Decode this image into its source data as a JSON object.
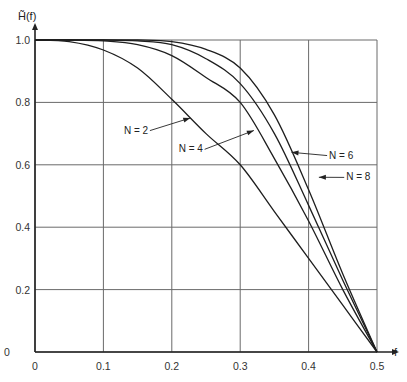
{
  "chart_data": {
    "type": "line",
    "title": "",
    "xlabel": "f",
    "ylabel": "H̃(f)",
    "xlim": [
      0,
      0.5
    ],
    "ylim": [
      0,
      1.0
    ],
    "grid": true,
    "x_ticks": [
      "0",
      "0.1",
      "0.2",
      "0.3",
      "0.4",
      "0.5"
    ],
    "y_ticks": [
      "0",
      "0.2",
      "0.4",
      "0.6",
      "0.8",
      "1.0"
    ],
    "x": [
      0,
      0.05,
      0.1,
      0.15,
      0.2,
      0.25,
      0.3,
      0.35,
      0.4,
      0.45,
      0.5
    ],
    "series": [
      {
        "name": "N = 2",
        "values": [
          1.0,
          0.995,
          0.968,
          0.91,
          0.81,
          0.7,
          0.6,
          0.45,
          0.3,
          0.15,
          0.0
        ]
      },
      {
        "name": "N = 4",
        "values": [
          1.0,
          1.0,
          0.997,
          0.985,
          0.95,
          0.88,
          0.8,
          0.62,
          0.42,
          0.2,
          0.0
        ]
      },
      {
        "name": "N = 6",
        "values": [
          1.0,
          1.0,
          1.0,
          0.997,
          0.985,
          0.94,
          0.86,
          0.7,
          0.47,
          0.23,
          0.0
        ]
      },
      {
        "name": "N = 8",
        "values": [
          1.0,
          1.0,
          1.0,
          1.0,
          0.995,
          0.97,
          0.91,
          0.76,
          0.52,
          0.25,
          0.0
        ]
      }
    ],
    "annotations": [
      {
        "text": "N = 2",
        "x": 0.13,
        "y": 0.7,
        "points_to": [
          0.227,
          0.75
        ]
      },
      {
        "text": "N = 4",
        "x": 0.21,
        "y": 0.64,
        "points_to": [
          0.32,
          0.71
        ]
      },
      {
        "text": "N = 6",
        "x": 0.43,
        "y": 0.62,
        "points_to": [
          0.375,
          0.64
        ]
      },
      {
        "text": "N = 8",
        "x": 0.455,
        "y": 0.55,
        "points_to": [
          0.415,
          0.56
        ]
      }
    ],
    "legend_position": "none"
  },
  "axis": {
    "ylabel": "H̃(f)",
    "xlabel": "f",
    "origin_label": "0"
  }
}
